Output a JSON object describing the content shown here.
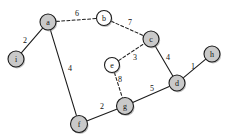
{
  "figure": {
    "kind": "weighted-undirected-graph",
    "width": 225,
    "height": 139,
    "background": "#ffffff",
    "node_fill_tree": "#c9c9c9",
    "node_fill_nontree": "#ffffff",
    "stroke": "#1c1c1c"
  },
  "chart_data": {
    "type": "diagram",
    "title": "",
    "xlabel": "",
    "ylabel": "",
    "nodes": [
      {
        "id": "a",
        "label": "a",
        "x": 48,
        "y": 22,
        "r": 8,
        "fill": "#c9c9c9"
      },
      {
        "id": "b",
        "label": "b",
        "x": 104,
        "y": 18,
        "r": 7.5,
        "fill": "#ffffff"
      },
      {
        "id": "c",
        "label": "c",
        "x": 151,
        "y": 39,
        "r": 8,
        "fill": "#c9c9c9"
      },
      {
        "id": "d",
        "label": "d",
        "x": 177,
        "y": 83,
        "r": 8,
        "fill": "#c9c9c9"
      },
      {
        "id": "e",
        "label": "e",
        "x": 112,
        "y": 65,
        "r": 7.5,
        "fill": "#ffffff"
      },
      {
        "id": "f",
        "label": "f",
        "x": 79,
        "y": 124,
        "r": 8.5,
        "fill": "#c9c9c9"
      },
      {
        "id": "g",
        "label": "g",
        "x": 125,
        "y": 106,
        "r": 8.5,
        "fill": "#c9c9c9"
      },
      {
        "id": "h",
        "label": "h",
        "x": 212,
        "y": 54,
        "r": 8,
        "fill": "#c9c9c9"
      },
      {
        "id": "i",
        "label": "i",
        "x": 16,
        "y": 59,
        "r": 8,
        "fill": "#c9c9c9"
      }
    ],
    "edges": [
      {
        "source": "i",
        "target": "a",
        "weight": 2,
        "style": "solid",
        "label_x": 25,
        "label_y": 40
      },
      {
        "source": "a",
        "target": "b",
        "weight": 6,
        "style": "dashed",
        "label_x": 77,
        "label_y": 13
      },
      {
        "source": "b",
        "target": "c",
        "weight": 7,
        "style": "dashed",
        "label_x": 130,
        "label_y": 22
      },
      {
        "source": "e",
        "target": "c",
        "weight": 3,
        "style": "dashed",
        "label_x": 135,
        "label_y": 57
      },
      {
        "source": "c",
        "target": "d",
        "weight": 4,
        "style": "solid",
        "label_x": 168,
        "label_y": 57
      },
      {
        "source": "d",
        "target": "h",
        "weight": 1,
        "style": "solid",
        "label_x": 193,
        "label_y": 66
      },
      {
        "source": "e",
        "target": "g",
        "weight": 8,
        "style": "dashed",
        "label_x": 120,
        "label_y": 79
      },
      {
        "source": "g",
        "target": "d",
        "weight": 5,
        "style": "solid",
        "label_x": 152,
        "label_y": 88
      },
      {
        "source": "f",
        "target": "g",
        "weight": 2,
        "style": "solid",
        "label_x": 102,
        "label_y": 106
      },
      {
        "source": "a",
        "target": "f",
        "weight": 4,
        "style": "solid",
        "label_x": 70,
        "label_y": 68
      }
    ],
    "legend": {
      "entries": []
    },
    "annotations": []
  }
}
